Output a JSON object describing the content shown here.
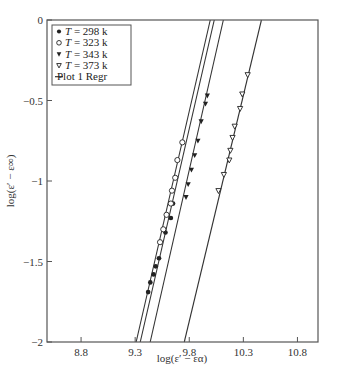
{
  "chart_data": {
    "type": "scatter",
    "title": "",
    "xlabel": "log(ε′ − εα)",
    "ylabel": "log(ε′ − ε∞)",
    "xlim": [
      8.485,
      10.99
    ],
    "ylim": [
      -2,
      0
    ],
    "x_ticks": [
      8.8,
      9.3,
      9.8,
      10.3,
      10.8
    ],
    "x_tick_labels": [
      "8.8",
      "9.3",
      "9.8",
      "10.3",
      "10.8"
    ],
    "y_ticks": [
      0,
      -0.5,
      -1,
      -1.5,
      -2
    ],
    "y_tick_labels": [
      "0",
      "−0.5",
      "−1",
      "−1.5",
      "−2"
    ],
    "grid": false,
    "legend_position": "upper left",
    "legend": [
      {
        "marker": "filled-circle",
        "label_italic": "T",
        "label_rest": " = 298 k"
      },
      {
        "marker": "open-circle",
        "label_italic": "T",
        "label_rest": " = 323 k"
      },
      {
        "marker": "filled-triangle-down",
        "label_italic": "T",
        "label_rest": " = 343 k"
      },
      {
        "marker": "open-triangle-down",
        "label_italic": "T",
        "label_rest": " = 373 k"
      },
      {
        "marker": "line",
        "label_italic": "",
        "label_rest": "Plot 1 Regr"
      }
    ],
    "series": [
      {
        "name": "T = 298 k",
        "marker": "filled-circle",
        "x": [
          9.65,
          9.63,
          9.58,
          9.52,
          9.49,
          9.47,
          9.44,
          9.42
        ],
        "y": [
          -1.14,
          -1.23,
          -1.32,
          -1.48,
          -1.53,
          -1.58,
          -1.63,
          -1.69
        ]
      },
      {
        "name": "T = 323 k",
        "marker": "open-circle",
        "x": [
          9.736,
          9.69,
          9.67,
          9.64,
          9.63,
          9.59,
          9.56,
          9.53
        ],
        "y": [
          -0.76,
          -0.87,
          -0.98,
          -1.06,
          -1.14,
          -1.21,
          -1.3,
          -1.38
        ]
      },
      {
        "name": "T = 343 k",
        "marker": "filled-triangle-down",
        "x": [
          9.967,
          9.95,
          9.91,
          9.88,
          9.85,
          9.82,
          9.79,
          9.77
        ],
        "y": [
          -0.47,
          -0.52,
          -0.63,
          -0.75,
          -0.84,
          -0.93,
          -1.02,
          -1.1
        ]
      },
      {
        "name": "T = 373 k",
        "marker": "open-triangle-down",
        "x": [
          10.34,
          10.29,
          10.27,
          10.22,
          10.2,
          10.18,
          10.17,
          10.12,
          10.07
        ],
        "y": [
          -0.34,
          -0.46,
          -0.55,
          -0.66,
          -0.73,
          -0.81,
          -0.87,
          -0.96,
          -1.06
        ]
      }
    ],
    "regression_lines": [
      {
        "name": "Plot 1 Regr (323 k)",
        "x": [
          9.309,
          9.994
        ],
        "y": [
          -2,
          0
        ]
      },
      {
        "name": "Plot 1 Regr (298 k)",
        "x": [
          9.347,
          10.031
        ],
        "y": [
          -2,
          0
        ]
      },
      {
        "name": "Plot 1 Regr (343 k)",
        "x": [
          9.439,
          10.115
        ],
        "y": [
          -2,
          0
        ]
      },
      {
        "name": "Plot 1 Regr (373 k)",
        "x": [
          9.754,
          10.467
        ],
        "y": [
          -2,
          0
        ]
      }
    ]
  },
  "colors": {
    "axis": "#555555",
    "line": "#333333",
    "marker": "#222222",
    "background": "#ffffff"
  }
}
